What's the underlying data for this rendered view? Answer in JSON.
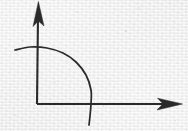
{
  "figure": {
    "title": "hand-drawn quarter-arc with coordinate axes",
    "width": 188,
    "height": 131,
    "background_color": "#f3f3f3",
    "ink_color": "#2b2b2b",
    "medium": "ink on textured paper"
  },
  "chart_data": {
    "type": "line",
    "title": "",
    "xlabel": "",
    "ylabel": "",
    "grid": false,
    "legend": null,
    "axes": {
      "origin": [
        37,
        104
      ],
      "x_axis": {
        "label": "",
        "from": [
          37,
          104
        ],
        "to": [
          182,
          104
        ],
        "arrow": "right",
        "tick_labels": []
      },
      "y_axis": {
        "label": "",
        "from": [
          37,
          104
        ],
        "to": [
          38,
          2
        ],
        "arrow": "up",
        "tick_labels": []
      }
    },
    "series": [
      {
        "name": "arc",
        "shape": "quarter-circle",
        "center": [
          37,
          104
        ],
        "radius_x": 53,
        "radius_y": 55,
        "stroke": "#2b2b2b",
        "points": [
          [
            15,
            50
          ],
          [
            30,
            47
          ],
          [
            47,
            48
          ],
          [
            63,
            53
          ],
          [
            76,
            62
          ],
          [
            86,
            75
          ],
          [
            91,
            90
          ],
          [
            91,
            104
          ],
          [
            90,
            116
          ],
          [
            89,
            125
          ]
        ]
      }
    ]
  },
  "elements": {
    "y_axis_name": "vertical-axis",
    "x_axis_name": "horizontal-axis",
    "arc_name": "quarter-arc-curve",
    "y_arrowhead_name": "y-axis-arrowhead",
    "x_arrowhead_name": "x-axis-arrowhead"
  }
}
